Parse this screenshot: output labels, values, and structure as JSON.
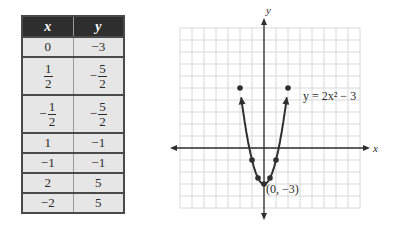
{
  "table": {
    "headers": [
      "x",
      "y"
    ],
    "rows": [
      {
        "x": "0",
        "y": "−3"
      },
      {
        "x": {
          "sign": "",
          "num": "1",
          "den": "2"
        },
        "y": {
          "sign": "−",
          "num": "5",
          "den": "2"
        }
      },
      {
        "x": {
          "sign": "−",
          "num": "1",
          "den": "2"
        },
        "y": {
          "sign": "−",
          "num": "5",
          "den": "2"
        }
      },
      {
        "x": "1",
        "y": "−1"
      },
      {
        "x": "−1",
        "y": "−1"
      },
      {
        "x": "2",
        "y": "5"
      },
      {
        "x": "−2",
        "y": "5"
      }
    ]
  },
  "chart_data": {
    "type": "line",
    "title": "",
    "function": "y = 2x^2 - 3",
    "curve_label": "y = 2x² − 3",
    "vertex_label": "(0, −3)",
    "xlabel": "x",
    "ylabel": "y",
    "xlim": [
      -7,
      8
    ],
    "ylim": [
      -5,
      10
    ],
    "grid": true,
    "grid_step": 1,
    "points": [
      {
        "x": -2,
        "y": 5
      },
      {
        "x": -1,
        "y": -1
      },
      {
        "x": -0.5,
        "y": -2.5
      },
      {
        "x": 0,
        "y": -3
      },
      {
        "x": 0.5,
        "y": -2.5
      },
      {
        "x": 1,
        "y": -1
      },
      {
        "x": 2,
        "y": 5
      }
    ],
    "curve_x_range": [
      -1.9,
      1.9
    ],
    "colors": {
      "curve": "#2f2f2f",
      "grid": "#d8d8d8",
      "axis": "#2f2f2f",
      "header_bg": "#2e2e2e",
      "cell_bg": "#e6e6e6"
    }
  }
}
